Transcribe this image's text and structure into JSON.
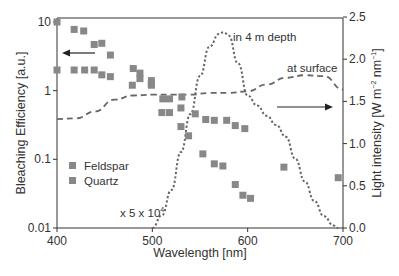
{
  "chart_data": {
    "type": "scatter",
    "title": "",
    "xlabel": "Wavelength [nm]",
    "ylabel": "Bleaching Efficiency [a.u.]",
    "y2label": "Light intensity [W m⁻² nm⁻¹]",
    "xlim": [
      400,
      700
    ],
    "ylim": [
      0.01,
      10
    ],
    "yscale": "log",
    "y2lim": [
      0.0,
      2.5
    ],
    "x_ticks": [
      "400",
      "500",
      "600",
      "700"
    ],
    "y_ticks": [
      "0.01",
      "0.1",
      "1",
      "10"
    ],
    "y2_ticks": [
      "0.0",
      "0.5",
      "1.0",
      "1.5",
      "2.0",
      "2.5"
    ],
    "grid": false,
    "legend": {
      "position": "left-middle",
      "entries": [
        "Feldspar",
        "Quartz"
      ]
    },
    "series": [
      {
        "name": "Feldspar",
        "type": "scatter",
        "marker": "square",
        "color": "#888888",
        "axis": "left",
        "points": [
          [
            400,
            10.0
          ],
          [
            418,
            7.8
          ],
          [
            428,
            7.4
          ],
          [
            439,
            4.7
          ],
          [
            447,
            4.9
          ],
          [
            456,
            3.3
          ],
          [
            480,
            2.1
          ],
          [
            487,
            1.8
          ],
          [
            487,
            1.5
          ],
          [
            499,
            1.4
          ],
          [
            499,
            1.2
          ],
          [
            511,
            0.76
          ],
          [
            518,
            0.76
          ],
          [
            531,
            0.81
          ],
          [
            530,
            0.56
          ],
          [
            545,
            0.46
          ],
          [
            556,
            0.38
          ],
          [
            565,
            0.37
          ],
          [
            578,
            0.37
          ],
          [
            587,
            0.31
          ],
          [
            597,
            0.28
          ]
        ]
      },
      {
        "name": "Quartz",
        "type": "scatter",
        "marker": "square",
        "color": "#888888",
        "axis": "left",
        "points": [
          [
            400,
            2.0
          ],
          [
            418,
            2.0
          ],
          [
            429,
            2.0
          ],
          [
            439,
            2.0
          ],
          [
            447,
            1.7
          ],
          [
            456,
            1.6
          ],
          [
            479,
            1.2
          ],
          [
            499,
            1.25
          ],
          [
            510,
            0.48
          ],
          [
            518,
            0.48
          ],
          [
            530,
            0.3
          ],
          [
            538,
            0.22
          ],
          [
            553,
            0.12
          ],
          [
            565,
            0.086
          ],
          [
            574,
            0.08
          ],
          [
            587,
            0.043
          ],
          [
            595,
            0.03
          ],
          [
            603,
            0.027
          ],
          [
            638,
            0.077
          ],
          [
            695,
            0.054
          ]
        ]
      },
      {
        "name": "at surface",
        "type": "line",
        "style": "dashed",
        "color": "#666666",
        "axis": "right",
        "x": [
          400,
          420,
          440,
          460,
          480,
          500,
          520,
          540,
          560,
          580,
          600,
          620,
          640,
          660,
          680,
          700
        ],
        "values": [
          1.29,
          1.3,
          1.38,
          1.52,
          1.57,
          1.58,
          1.58,
          1.58,
          1.6,
          1.6,
          1.62,
          1.7,
          1.78,
          1.81,
          1.8,
          1.64
        ]
      },
      {
        "name": "in 4 m depth",
        "type": "line",
        "style": "dotted",
        "color": "#666666",
        "axis": "right",
        "scale_note": "x 5 x 10⁴",
        "x": [
          500,
          510,
          520,
          530,
          540,
          550,
          560,
          570,
          575,
          580,
          590,
          600,
          610,
          620,
          630,
          640,
          650,
          660,
          670,
          680,
          690,
          695
        ],
        "values": [
          0.0,
          0.15,
          0.45,
          0.9,
          1.35,
          1.8,
          2.15,
          2.3,
          2.32,
          2.28,
          1.95,
          1.57,
          1.45,
          1.33,
          1.22,
          1.08,
          0.82,
          0.55,
          0.32,
          0.14,
          0.03,
          0.0
        ]
      }
    ],
    "annotations": [
      {
        "text": "in 4 m depth",
        "x": 585,
        "y": 2.35,
        "axis": "right"
      },
      {
        "text": "at surface",
        "x": 655,
        "y": 1.95,
        "axis": "right"
      },
      {
        "text": "x 5 x 10⁴",
        "x": 471,
        "y": 0.017,
        "axis": "left"
      },
      {
        "text": "← arrow pointing to left axis",
        "x": 430,
        "y": 3.2
      },
      {
        "text": "→ arrow pointing to right axis",
        "x": 670,
        "y": 1.45
      }
    ]
  },
  "labels": {
    "xlabel": "Wavelength [nm]",
    "ylabel": "Bleaching Efficiency [a.u.]",
    "y2label_main": "Light intensity [W m",
    "y2label_sup1": "−2",
    "y2label_mid": " nm",
    "y2label_sup2": "−1",
    "y2label_end": "]",
    "ann_depth": "in 4 m depth",
    "ann_surface": "at surface",
    "ann_scale_base": "x 5 x 10",
    "ann_scale_exp": "4",
    "legend_feldspar": "Feldspar",
    "legend_quartz": "Quartz"
  },
  "colors": {
    "marker": "#888888",
    "line": "#666666",
    "axis": "#333333"
  }
}
